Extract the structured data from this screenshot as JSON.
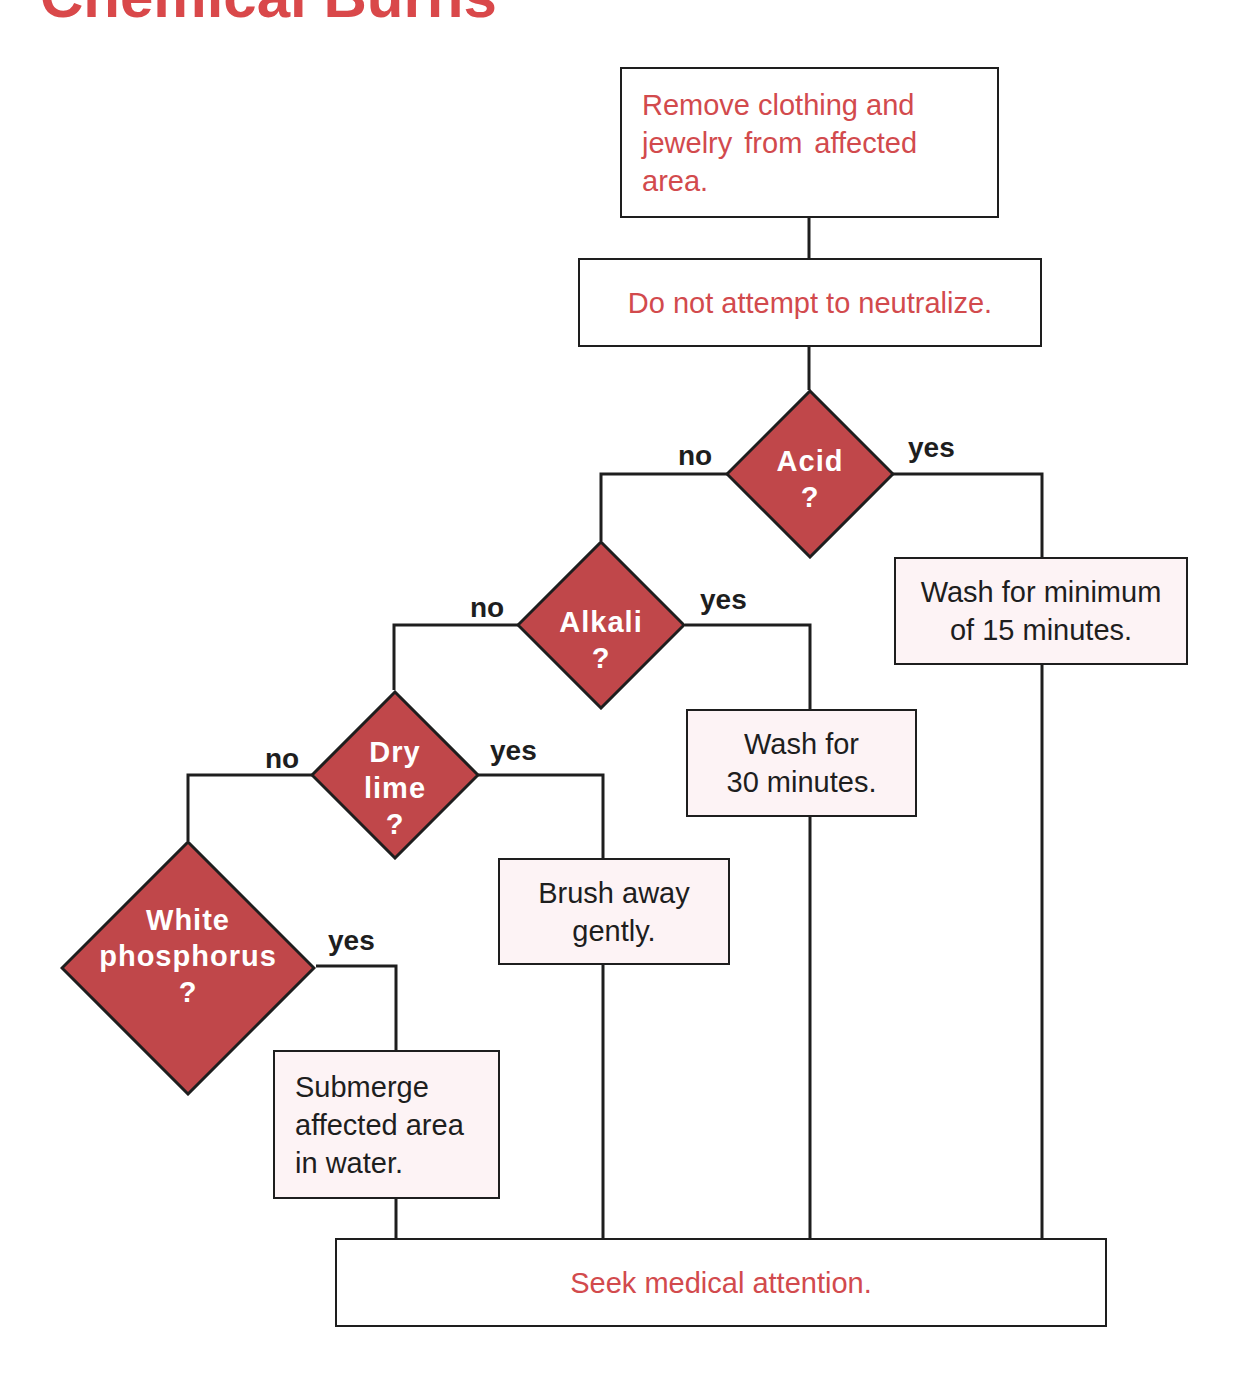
{
  "title": "Chemical Burns",
  "colors": {
    "title": "#d9484a",
    "diamond_fill": "#c0474a",
    "red_text": "#d24a4d",
    "action_fill": "#fdf3f5",
    "line": "#1e1e1e"
  },
  "steps": {
    "remove": [
      "Remove clothing and",
      "jewelry  from  affected",
      "area."
    ],
    "neutralize": "Do not attempt to neutralize.",
    "seek": "Seek medical attention."
  },
  "decisions": {
    "acid": [
      "Acid",
      "?"
    ],
    "alkali": [
      "Alkali",
      "?"
    ],
    "dry_lime": [
      "Dry",
      "lime",
      "?"
    ],
    "white_phosphorus": [
      "White",
      "phosphorus",
      "?"
    ]
  },
  "actions": {
    "acid": [
      "Wash for minimum",
      "of 15 minutes."
    ],
    "alkali": [
      "Wash for",
      "30 minutes."
    ],
    "dry_lime": [
      "Brush away",
      "gently."
    ],
    "white_phosphorus": [
      "Submerge",
      "affected area",
      "in water."
    ]
  },
  "branch_labels": {
    "yes": "yes",
    "no": "no"
  }
}
